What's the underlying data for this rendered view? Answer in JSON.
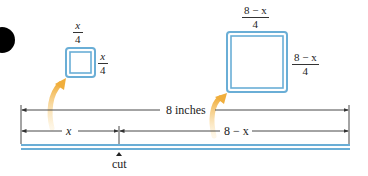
{
  "diagram": {
    "small_square": {
      "top_label": {
        "num": "x",
        "den": "4"
      },
      "side_label": {
        "num": "x",
        "den": "4"
      }
    },
    "large_square": {
      "top_label": {
        "num": "8 − x",
        "den": "4"
      },
      "side_label": {
        "num": "8 − x",
        "den": "4"
      }
    },
    "dimensions": {
      "total": "8 inches",
      "left_segment": "x",
      "right_segment": "8 − x"
    },
    "cut_label": "cut",
    "colors": {
      "wire": "#6aaed6",
      "arrow": "#f0b040",
      "dimension_line": "#333333",
      "bullet": "#000000"
    }
  }
}
